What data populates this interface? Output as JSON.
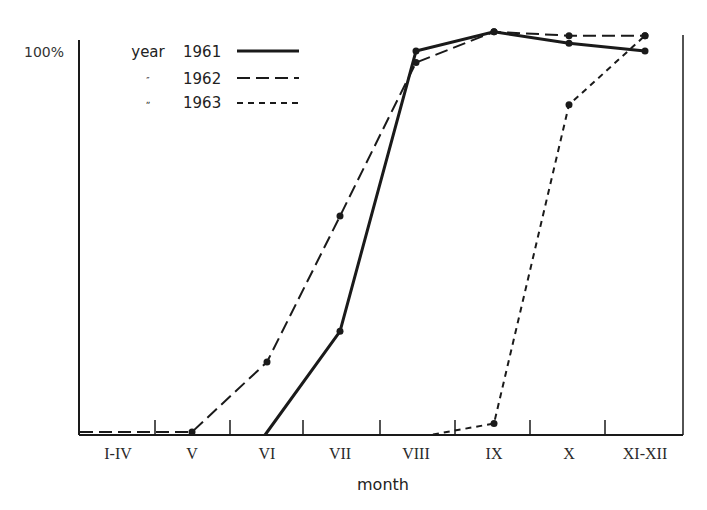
{
  "chart_data": {
    "type": "line",
    "title": "",
    "xlabel": "month",
    "ylabel": "",
    "y_tick_labels": [
      "100%"
    ],
    "ylim": [
      0,
      100
    ],
    "categories": [
      "I-IV",
      "V",
      "VI",
      "VII",
      "VIII",
      "IX",
      "X",
      "XI-XII"
    ],
    "grid": false,
    "legend_position": "top-left inside",
    "legend_title": "year",
    "series": [
      {
        "name": "1961",
        "style": "solid",
        "values": [
          null,
          null,
          0,
          27,
          100,
          105,
          102,
          100
        ]
      },
      {
        "name": "1962",
        "style": "long-dash",
        "values": [
          1,
          1,
          19,
          57,
          97,
          105,
          104,
          104
        ]
      },
      {
        "name": "1963",
        "style": "short-dash",
        "values": [
          null,
          null,
          null,
          null,
          0,
          3,
          86,
          104
        ]
      }
    ]
  },
  "legend": {
    "rows": [
      {
        "prefix": "year",
        "label": "1961"
      },
      {
        "prefix": "″",
        "label": "1962"
      },
      {
        "prefix": "ˮ",
        "label": "1963"
      }
    ]
  },
  "axis": {
    "y_label_top": "100%",
    "x_title": "month",
    "x_ticks": [
      "I-IV",
      "V",
      "VI",
      "VII",
      "VIII",
      "IX",
      "X",
      "XI-XII"
    ]
  }
}
